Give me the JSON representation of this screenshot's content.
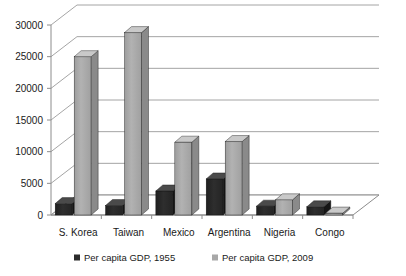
{
  "chart_data": {
    "type": "bar",
    "title": "",
    "subtitle": "",
    "xlabel": "",
    "ylabel": "",
    "categories": [
      "S. Korea",
      "Taiwan",
      "Mexico",
      "Argentina",
      "Nigeria",
      "Congo"
    ],
    "series": [
      {
        "name": "Per capita GDP, 1955",
        "color": "#2b2b2b",
        "values": [
          1800,
          1500,
          3800,
          5700,
          1400,
          1300
        ]
      },
      {
        "name": "Per capita GDP, 2009",
        "color": "#a8a8a8",
        "values": [
          25000,
          28800,
          11500,
          11600,
          2400,
          300
        ]
      }
    ],
    "ylim": [
      0,
      30000
    ],
    "yticks": [
      0,
      5000,
      10000,
      15000,
      20000,
      25000,
      30000
    ],
    "ytick_labels": [
      "0",
      "5000",
      "10000",
      "15000",
      "20000",
      "25000",
      "30000"
    ],
    "grid": true,
    "legend_position": "bottom",
    "style": "3d-clustered-column"
  },
  "legend": {
    "items": [
      {
        "label": "Per capita GDP, 1955",
        "color": "#2b2b2b",
        "marker": "square-marker"
      },
      {
        "label": "Per capita GDP, 2009",
        "color": "#a8a8a8",
        "marker": "square-marker"
      }
    ]
  },
  "colors": {
    "series_1955": "#2b2b2b",
    "series_2009": "#a8a8a8",
    "gridline": "#9a9a9a",
    "axis": "#8c8c8c",
    "background": "#ffffff",
    "text": "#1a1a1a"
  }
}
